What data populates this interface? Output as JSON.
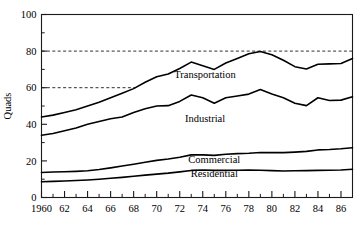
{
  "chart_data": {
    "type": "line",
    "title": "",
    "subtitle": "",
    "xlabel": "",
    "ylabel": "Quads",
    "xlim": [
      1960,
      1987
    ],
    "ylim": [
      0,
      100
    ],
    "grid": "dashed horizontal gridlines at 60 and 80",
    "legend_position": "inline series labels on plot",
    "y_ticks": [
      0,
      20,
      40,
      60,
      80,
      100
    ],
    "y_tick_labels": [
      "0",
      "20",
      "40",
      "60",
      "80",
      "100"
    ],
    "x_ticks": [
      1960,
      1962,
      1964,
      1966,
      1968,
      1970,
      1972,
      1974,
      1976,
      1978,
      1980,
      1982,
      1984,
      1986
    ],
    "x_tick_labels": [
      "1960",
      "62",
      "64",
      "66",
      "68",
      "70",
      "72",
      "74",
      "76",
      "78",
      "80",
      "82",
      "84",
      "86"
    ],
    "x_minor_ticks": [
      1961,
      1963,
      1965,
      1967,
      1969,
      1971,
      1973,
      1975,
      1977,
      1979,
      1981,
      1983,
      1985,
      1987
    ],
    "gridlines": [
      60,
      80
    ],
    "x": [
      1960,
      1961,
      1962,
      1963,
      1964,
      1965,
      1966,
      1967,
      1968,
      1969,
      1970,
      1971,
      1972,
      1973,
      1974,
      1975,
      1976,
      1977,
      1978,
      1979,
      1980,
      1981,
      1982,
      1983,
      1984,
      1985,
      1986,
      1987
    ],
    "series": [
      {
        "name": "Transportation",
        "label": "Transportation",
        "label_x": 1974.2,
        "label_y": 65.5,
        "color": "#000000",
        "values": [
          44.0,
          45.0,
          46.5,
          48.0,
          50.0,
          52.0,
          54.5,
          57.0,
          59.5,
          63.0,
          66.0,
          67.5,
          70.5,
          74.0,
          72.0,
          70.0,
          73.5,
          76.0,
          78.5,
          79.8,
          78.0,
          75.0,
          71.5,
          70.2,
          72.8,
          73.0,
          73.2,
          76.0
        ]
      },
      {
        "name": "Industrial",
        "label": "Industrial",
        "label_x": 1974.2,
        "label_y": 41.0,
        "color": "#000000",
        "values": [
          34.0,
          35.0,
          36.5,
          38.0,
          40.0,
          41.5,
          43.0,
          44.0,
          46.5,
          48.5,
          50.0,
          50.2,
          52.5,
          56.0,
          54.5,
          51.5,
          54.5,
          55.5,
          56.5,
          59.0,
          56.5,
          54.5,
          51.5,
          50.2,
          54.5,
          53.0,
          53.2,
          55.0
        ]
      },
      {
        "name": "Commercial",
        "label": "Commercial",
        "label_x": 1975.0,
        "label_y": 19.0,
        "color": "#000000",
        "values": [
          13.7,
          13.9,
          14.1,
          14.3,
          14.6,
          15.3,
          16.2,
          17.2,
          18.2,
          19.3,
          20.3,
          21.0,
          22.0,
          23.3,
          23.3,
          23.0,
          23.6,
          24.0,
          24.2,
          24.6,
          24.5,
          24.5,
          24.8,
          25.2,
          26.0,
          26.2,
          26.6,
          27.2
        ]
      },
      {
        "name": "Residential",
        "label": "Residential",
        "label_x": 1975.0,
        "label_y": 11.0,
        "color": "#000000",
        "values": [
          8.6,
          8.8,
          9.0,
          9.3,
          9.6,
          10.0,
          10.5,
          11.0,
          11.6,
          12.2,
          12.8,
          13.3,
          14.0,
          14.8,
          15.0,
          14.8,
          14.8,
          14.9,
          15.0,
          14.9,
          14.7,
          14.5,
          14.6,
          14.7,
          14.8,
          14.9,
          15.0,
          15.4
        ]
      }
    ]
  }
}
